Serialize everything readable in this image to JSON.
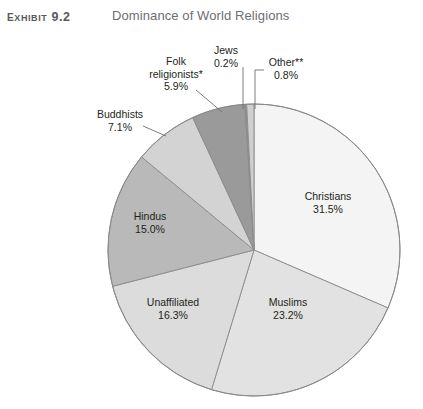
{
  "header": {
    "exhibit_label": "Exhibit 9.2",
    "title": "Dominance of World Religions"
  },
  "chart_data": {
    "type": "pie",
    "title": "Dominance of World Religions",
    "xlabel": "",
    "ylabel": "",
    "legend_position": "none",
    "grid": false,
    "start_angle_deg": 0,
    "direction": "clockwise",
    "categories": [
      "Christians",
      "Muslims",
      "Unaffiliated",
      "Hindus",
      "Buddhists",
      "Folk religionists*",
      "Jews",
      "Other**"
    ],
    "values": [
      31.5,
      23.2,
      16.3,
      15.0,
      7.1,
      5.9,
      0.2,
      0.8
    ],
    "value_unit": "percent",
    "slices": [
      {
        "name": "Christians",
        "label": "Christians",
        "pct_text": "31.5%",
        "value": 31.5,
        "color": "#f4f4f4",
        "label_placement": "inside"
      },
      {
        "name": "Muslims",
        "label": "Muslims",
        "pct_text": "23.2%",
        "value": 23.2,
        "color": "#e2e2e2",
        "label_placement": "inside"
      },
      {
        "name": "Unaffiliated",
        "label": "Unaffiliated",
        "pct_text": "16.3%",
        "value": 16.3,
        "color": "#dcdcdc",
        "label_placement": "inside"
      },
      {
        "name": "Hindus",
        "label": "Hindus",
        "pct_text": "15.0%",
        "value": 15.0,
        "color": "#b9b9b9",
        "label_placement": "inside"
      },
      {
        "name": "Buddhists",
        "label": "Buddhists",
        "pct_text": "7.1%",
        "value": 7.1,
        "color": "#d3d3d3",
        "label_placement": "callout"
      },
      {
        "name": "Folk religionists*",
        "label": "Folk religionists*",
        "pct_text": "5.9%",
        "value": 5.9,
        "color": "#9a9a9a",
        "label_placement": "callout"
      },
      {
        "name": "Jews",
        "label": "Jews",
        "pct_text": "0.2%",
        "value": 0.2,
        "color": "#8f8f8f",
        "label_placement": "callout"
      },
      {
        "name": "Other**",
        "label": "Other**",
        "pct_text": "0.8%",
        "value": 0.8,
        "color": "#cfcfcf",
        "label_placement": "callout"
      }
    ]
  },
  "labels": {
    "christians": {
      "name": "Christians",
      "pct": "31.5%"
    },
    "muslims": {
      "name": "Muslims",
      "pct": "23.2%"
    },
    "unaffiliated": {
      "name": "Unaffiliated",
      "pct": "16.3%"
    },
    "hindus": {
      "name": "Hindus",
      "pct": "15.0%"
    },
    "buddhists": {
      "name": "Buddhists",
      "pct": "7.1%"
    },
    "folk_religionists": {
      "name": "Folk",
      "name2": "religionists*",
      "pct": "5.9%"
    },
    "jews": {
      "name": "Jews",
      "pct": "0.2%"
    },
    "other": {
      "name": "Other**",
      "pct": "0.8%"
    }
  },
  "colors": {
    "outline": "#8a8a8a",
    "leader_line": "#6e6e6e",
    "text": "#231f20",
    "title_text": "#6d6e71"
  },
  "geometry": {
    "center_x": 254,
    "center_y": 216,
    "radius": 146
  }
}
